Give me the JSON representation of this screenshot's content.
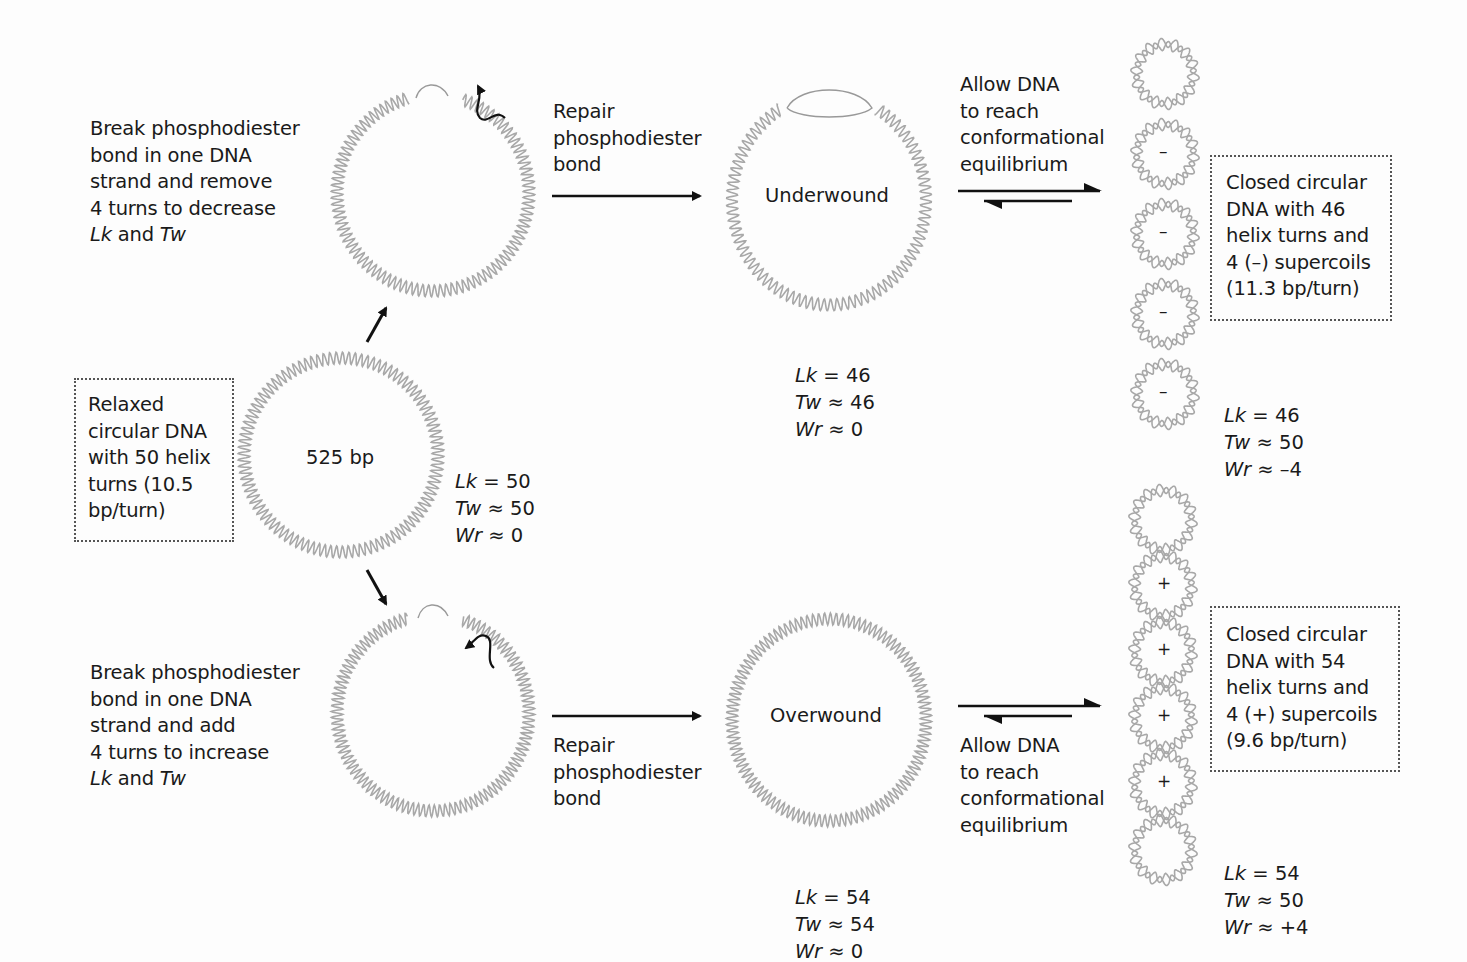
{
  "colors": {
    "text": "#1a1a1a",
    "dna_strand": "#a8a8a8",
    "arrow": "#111111",
    "box_border": "#555555"
  },
  "relaxed": {
    "box_lines": [
      "Relaxed",
      "circular DNA",
      "with 50 helix",
      "turns (10.5",
      "bp/turn)"
    ],
    "center_label": "525 bp",
    "lk": "Lk = 50",
    "tw": "Tw ≈ 50",
    "wr": "Wr ≈ 0"
  },
  "top": {
    "step1_lines": [
      "Break phosphodiester",
      "bond in one DNA",
      "strand and remove",
      "4 turns to decrease"
    ],
    "step1_last": {
      "a": "Lk",
      "b": " and ",
      "c": "Tw"
    },
    "repair_lines": [
      "Repair",
      "phosphodiester",
      "bond"
    ],
    "state_label": "Underwound",
    "state_lk": "Lk = 46",
    "state_tw": "Tw ≈ 46",
    "state_wr": "Wr ≈ 0",
    "equilibrium_lines": [
      "Allow DNA",
      "to reach",
      "conformational",
      "equilibrium"
    ],
    "final_box_lines": [
      "Closed circular",
      "DNA with 46",
      "helix turns and",
      "4 (–) supercoils",
      "(11.3 bp/turn)"
    ],
    "supercoil_signs": [
      "",
      "–",
      "–",
      "–",
      "–"
    ],
    "final_lk": "Lk = 46",
    "final_tw": "Tw ≈ 50",
    "final_wr": "Wr ≈ –4"
  },
  "bottom": {
    "step1_lines": [
      "Break phosphodiester",
      "bond in one DNA",
      "strand and add",
      "4 turns to increase"
    ],
    "step1_last": {
      "a": "Lk",
      "b": " and ",
      "c": "Tw"
    },
    "repair_lines": [
      "Repair",
      "phosphodiester",
      "bond"
    ],
    "state_label": "Overwound",
    "state_lk": "Lk = 54",
    "state_tw": "Tw ≈ 54",
    "state_wr": "Wr ≈ 0",
    "equilibrium_lines": [
      "Allow DNA",
      "to reach",
      "conformational",
      "equilibrium"
    ],
    "final_box_lines": [
      "Closed circular",
      "DNA with 54",
      "helix turns and",
      "4 (+) supercoils",
      "(9.6 bp/turn)"
    ],
    "supercoil_signs": [
      "",
      "+",
      "+",
      "+",
      "+",
      ""
    ],
    "final_lk": "Lk = 54",
    "final_tw": "Tw ≈ 50",
    "final_wr": "Wr ≈ +4"
  }
}
